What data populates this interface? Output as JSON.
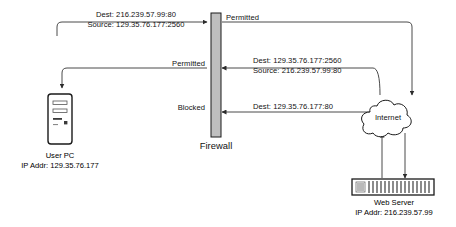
{
  "diagram": {
    "colors": {
      "line": "#4a4a4a",
      "text": "#111111",
      "firewall_fill": "#bfbfbf",
      "firewall_stroke": "#1a1a1a",
      "node_stroke": "#1a1a1a",
      "background": "#ffffff"
    },
    "nodes": {
      "user_pc": {
        "name": "User PC",
        "caption_line1": "User PC",
        "caption_line2": "IP Addr: 129.35.76.177"
      },
      "firewall": {
        "name": "Firewall",
        "caption": "Firewall"
      },
      "internet": {
        "name": "Internet",
        "caption": "Internet"
      },
      "web_server": {
        "name": "Web Server",
        "caption_line1": "Web Server",
        "caption_line2": "IP Addr: 216.239.57.99"
      }
    },
    "flows": [
      {
        "id": "outbound-request",
        "packet_line1": "Dest: 216.239.57.99:80",
        "packet_line2": "Source: 129.35.76.177:2560",
        "verdict": "Permitted",
        "direction": "user-pc-to-internet"
      },
      {
        "id": "inbound-response",
        "packet_line1": "Dest: 129.35.76.177:2560",
        "packet_line2": "Source: 216.239.57.99:80",
        "verdict": "Permitted",
        "direction": "internet-to-user-pc"
      },
      {
        "id": "inbound-unsolicited",
        "packet_line1": "Dest: 129.35.76.177:80",
        "packet_line2": "",
        "verdict": "Blocked",
        "direction": "internet-to-user-pc"
      }
    ]
  }
}
